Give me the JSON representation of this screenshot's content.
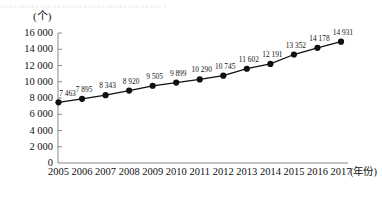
{
  "clipped_header_text": "。。。。。。。。。。。。。。。。。。。。。。。。。。。。。。。。。。。。。。",
  "axes": {
    "y_unit_label": "(个)",
    "x_unit_label": "(年份)",
    "y_ticks": [
      "0",
      "2 000",
      "4 000",
      "6 000",
      "8 000",
      "10 000",
      "12 000",
      "14 000",
      "16 000"
    ],
    "y_tick_values": [
      0,
      2000,
      4000,
      6000,
      8000,
      10000,
      12000,
      14000,
      16000
    ],
    "axis_color": "#8a8a8a",
    "line_color": "#101010",
    "marker_color": "#101010"
  },
  "chart_data": {
    "type": "line",
    "title": "",
    "xlabel": "(年份)",
    "ylabel": "(个)",
    "ylim": [
      0,
      16000
    ],
    "grid": false,
    "legend": null,
    "categories": [
      "2005",
      "2006",
      "2007",
      "2008",
      "2009",
      "2010",
      "2011",
      "2012",
      "2013",
      "2014",
      "2015",
      "2016",
      "2017"
    ],
    "values": [
      7463,
      7895,
      8343,
      8920,
      9505,
      9899,
      10290,
      10745,
      11602,
      12191,
      13352,
      14178,
      14931
    ],
    "data_labels": [
      "7 463",
      "7 895",
      "8 343",
      "8 920",
      "9 505",
      "9 899",
      "10 290",
      "10 745",
      "11 602",
      "12 191",
      "13 352",
      "14 178",
      "14 931"
    ]
  }
}
